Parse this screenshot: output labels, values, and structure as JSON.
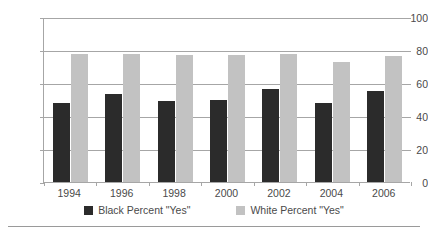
{
  "chart_data": {
    "type": "bar",
    "title": "",
    "xlabel": "",
    "ylabel": "",
    "categories": [
      "1994",
      "1996",
      "1998",
      "2000",
      "2002",
      "2004",
      "2006"
    ],
    "series": [
      {
        "name": "Black Percent \"Yes\"",
        "color": "#2b2b2b",
        "values": [
          48,
          53.5,
          49,
          49.5,
          56.5,
          48,
          55
        ]
      },
      {
        "name": "White Percent \"Yes\"",
        "color": "#c2c2c2",
        "values": [
          77.5,
          77.5,
          77,
          77,
          77.5,
          73,
          76.5
        ]
      }
    ],
    "ylim": [
      0,
      100
    ],
    "yticks": [
      "0",
      "20",
      "40",
      "60",
      "80",
      "100"
    ],
    "grid": true,
    "legend_position": "bottom"
  },
  "colors": {
    "axis": "#a6a6a6",
    "grid": "#a6a6a6",
    "text": "#4a4a4a",
    "background": "#ffffff"
  }
}
